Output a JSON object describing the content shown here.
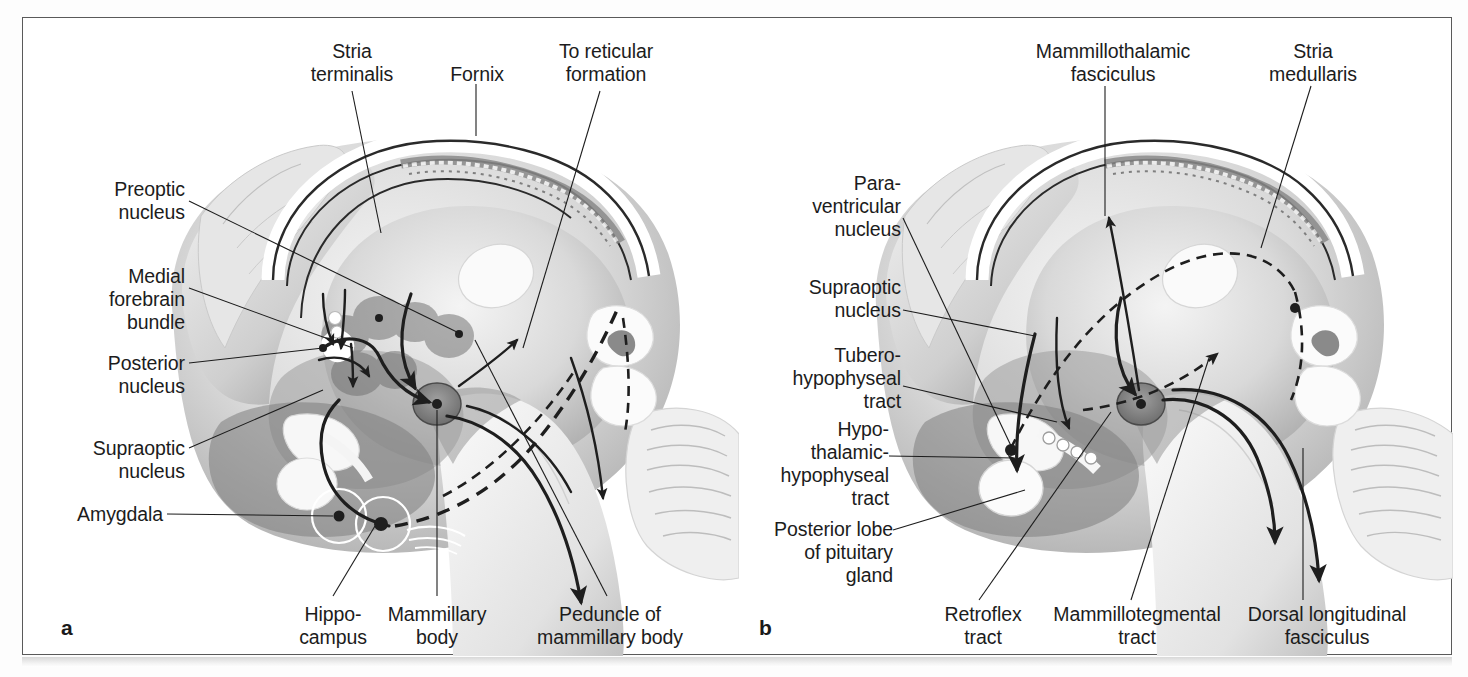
{
  "figure": {
    "panels": [
      {
        "id": "a",
        "letter": "a",
        "labels": [
          {
            "key": "stria_terminalis",
            "text": "Stria\nterminalis"
          },
          {
            "key": "fornix",
            "text": "Fornix"
          },
          {
            "key": "to_reticular_formation",
            "text": "To reticular\nformation"
          },
          {
            "key": "preoptic_nucleus",
            "text": "Preoptic\nnucleus"
          },
          {
            "key": "medial_forebrain_bundle",
            "text": "Medial\nforebrain\nbundle"
          },
          {
            "key": "posterior_nucleus",
            "text": "Posterior\nnucleus"
          },
          {
            "key": "supraoptic_nucleus",
            "text": "Supraoptic\nnucleus"
          },
          {
            "key": "amygdala",
            "text": "Amygdala"
          },
          {
            "key": "hippocampus",
            "text": "Hippo-\ncampus"
          },
          {
            "key": "mammillary_body",
            "text": "Mammillary\nbody"
          },
          {
            "key": "peduncle_of_mammillary_body",
            "text": "Peduncle of\nmammillary body"
          }
        ]
      },
      {
        "id": "b",
        "letter": "b",
        "labels": [
          {
            "key": "mammillothalamic_fasciculus",
            "text": "Mammillothalamic\nfasciculus"
          },
          {
            "key": "stria_medullaris",
            "text": "Stria\nmedullaris"
          },
          {
            "key": "paraventricular_nucleus",
            "text": "Para-\nventricular\nnucleus"
          },
          {
            "key": "supraoptic_nucleus",
            "text": "Supraoptic\nnucleus"
          },
          {
            "key": "tuberohypophyseal_tract",
            "text": "Tubero-\nhypophyseal\ntract"
          },
          {
            "key": "hypothalamic_hypophyseal_tract",
            "text": "Hypo-\nthalamic-\nhypophyseal\ntract"
          },
          {
            "key": "posterior_lobe_of_pituitary_gland",
            "text": "Posterior lobe\nof pituitary\ngland"
          },
          {
            "key": "retroflex_tract",
            "text": "Retroflex\ntract"
          },
          {
            "key": "mammillotegmental_tract",
            "text": "Mammillotegmental\ntract"
          },
          {
            "key": "dorsal_longitudinal_fasciculus",
            "text": "Dorsal longitudinal\nfasciculus"
          }
        ]
      }
    ],
    "colors": {
      "ink": "#1c1c1c",
      "frame": "#5a5a5a",
      "page": "#ffffff",
      "tissue_light": "#e9e9e9",
      "tissue_mid": "#b8b8b8",
      "tissue_dark": "#7c7c7c",
      "tissue_darker": "#5f5f5f"
    }
  }
}
